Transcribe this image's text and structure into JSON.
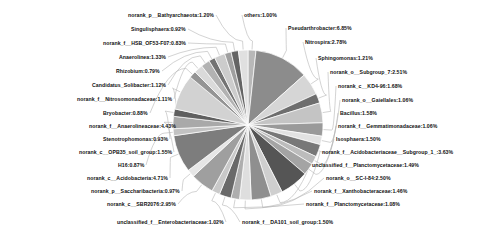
{
  "chart_data": {
    "type": "pie",
    "title": "",
    "xlabel": "",
    "ylabel": "",
    "legend_position": "none",
    "grid": false,
    "label_format": "name:percent",
    "center": [
      248,
      125
    ],
    "radius": 75,
    "categories": [
      "others",
      "Pseudarthrobacter",
      "Nitrospira",
      "Sphingomonas",
      "norank_o__Subgroup_7",
      "norank_c__KD4-96",
      "norank_o__Gaiellales",
      "Bacillus",
      "norank_f__Gemmatimonadaceae",
      "Isosphaera",
      "norank_f__Acidobacteriaceae__Subgroup_1_",
      "unclassified_f__Planctomycetaceae",
      "norank_o__SC-I-84",
      "norank_f__Xanthobacteraceae",
      "norank_f__Planctomycetaceae",
      "norank_f__DA101_soil_group",
      "unclassified_f__Enterobacteriaceae",
      "norank_c__SBR2076",
      "norank_p__Saccharibacteria",
      "norank_c__Acidobacteria",
      "H16",
      "norank_c__OPB35_soil_group",
      "Stenotrophomonas",
      "norank_f__Anaerolineaceae",
      "Bryobacter",
      "norank_f__Nitrosomonadaceae",
      "Candidatus_Solibacter",
      "Rhizobium",
      "Anaerolinea",
      "norank_f__HSB_OF53-F07",
      "Singulisphaera",
      "norank_p__Bathyarchaeota"
    ],
    "values": [
      1.0,
      6.85,
      2.78,
      1.21,
      2.51,
      1.68,
      1.06,
      1.58,
      1.06,
      1.5,
      3.63,
      1.49,
      2.5,
      1.46,
      1.08,
      1.5,
      1.02,
      2.95,
      0.97,
      4.71,
      0.87,
      1.55,
      0.93,
      4.43,
      0.88,
      1.11,
      1.12,
      0.79,
      1.33,
      0.83,
      0.92,
      1.2
    ],
    "labels": [
      "others:1.00%",
      "Pseudarthrobacter:6.85%",
      "Nitrospira:2.78%",
      "Sphingomonas:1.21%",
      "norank_o__Subgroup_7:2.51%",
      "norank_c__KD4-96:1.68%",
      "norank_o__Gaiellales:1.06%",
      "Bacillus:1.58%",
      "norank_f__Gemmatimonadaceae:1.06%",
      "Isosphaera:1.50%",
      "norank_f__Acidobacteriaceae__Subgroup_1_:3.63%",
      "unclassified_f__Planctomycetaceae:1.49%",
      "norank_o__SC-I-84:2.50%",
      "norank_f__Xanthobacteraceae:1.46%",
      "norank_f__Planctomycetaceae:1.08%",
      "norank_f__DA101_soil_group:1.50%",
      "unclassified_f__Enterobacteriaceae:1.02%",
      "norank_c__SBR2076:2.95%",
      "norank_p__Saccharibacteria:0.97%",
      "norank_c__Acidobacteria:4.71%",
      "H16:0.87%",
      "norank_c__OPB35_soil_group:1.55%",
      "Stenotrophomonas:0.93%",
      "norank_f__Anaerolineaceae:4.43%",
      "Bryobacter:0.88%",
      "norank_f__Nitrosomonadaceae:1.11%",
      "Candidatus_Solibacter:1.12%",
      "Rhizobium:0.79%",
      "Anaerolinea:1.33%",
      "norank_f__HSB_OF53-F07:0.83%",
      "Singulisphaera:0.92%",
      "norank_p__Bathyarchaeota:1.20%"
    ],
    "colors": [
      "#b8b8b8",
      "#8c8c8c",
      "#d6d6d6",
      "#6e6e6e",
      "#c4c4c4",
      "#9a9a9a",
      "#e2e2e2",
      "#787878",
      "#bcbcbc",
      "#a4a4a4",
      "#555555",
      "#cfcfcf",
      "#8f8f8f",
      "#dedede",
      "#aeaeae",
      "#696969",
      "#c9c9c9",
      "#9f9f9f",
      "#e6e6e6",
      "#7d7d7d",
      "#c2c2c2",
      "#a9a9a9",
      "#5f5f5f",
      "#d2d2d2",
      "#949494",
      "#dadada",
      "#b2b2b2",
      "#737373",
      "#cccccc",
      "#a0a0a0",
      "#646464",
      "#e0e0e0"
    ],
    "label_anchors": {
      "right": [
        {
          "text_key": 0,
          "x": 244,
          "y": 15,
          "side": "right"
        },
        {
          "text_key": 1,
          "x": 288,
          "y": 28,
          "side": "right"
        },
        {
          "text_key": 2,
          "x": 305,
          "y": 42,
          "side": "right"
        },
        {
          "text_key": 3,
          "x": 318,
          "y": 58,
          "side": "right"
        },
        {
          "text_key": 4,
          "x": 330,
          "y": 72,
          "side": "right"
        },
        {
          "text_key": 5,
          "x": 338,
          "y": 86,
          "side": "right"
        },
        {
          "text_key": 6,
          "x": 342,
          "y": 100,
          "side": "right"
        },
        {
          "text_key": 7,
          "x": 340,
          "y": 113,
          "side": "right"
        },
        {
          "text_key": 8,
          "x": 338,
          "y": 126,
          "side": "right"
        },
        {
          "text_key": 9,
          "x": 336,
          "y": 139,
          "side": "right"
        },
        {
          "text_key": 10,
          "x": 322,
          "y": 152,
          "side": "right"
        },
        {
          "text_key": 11,
          "x": 312,
          "y": 165,
          "side": "right"
        },
        {
          "text_key": 12,
          "x": 326,
          "y": 178,
          "side": "right"
        },
        {
          "text_key": 13,
          "x": 314,
          "y": 191,
          "side": "right"
        },
        {
          "text_key": 14,
          "x": 306,
          "y": 204,
          "side": "right"
        },
        {
          "text_key": 15,
          "x": 242,
          "y": 222,
          "side": "right"
        }
      ],
      "left": [
        {
          "text_key": 31,
          "x": 214,
          "y": 15,
          "side": "left"
        },
        {
          "text_key": 30,
          "x": 186,
          "y": 29,
          "side": "left"
        },
        {
          "text_key": 29,
          "x": 186,
          "y": 43,
          "side": "left"
        },
        {
          "text_key": 28,
          "x": 166,
          "y": 57,
          "side": "left"
        },
        {
          "text_key": 27,
          "x": 160,
          "y": 71,
          "side": "left"
        },
        {
          "text_key": 26,
          "x": 166,
          "y": 85,
          "side": "left"
        },
        {
          "text_key": 25,
          "x": 172,
          "y": 99,
          "side": "left"
        },
        {
          "text_key": 24,
          "x": 148,
          "y": 113,
          "side": "left"
        },
        {
          "text_key": 23,
          "x": 176,
          "y": 126,
          "side": "left"
        },
        {
          "text_key": 22,
          "x": 168,
          "y": 139,
          "side": "left"
        },
        {
          "text_key": 21,
          "x": 172,
          "y": 152,
          "side": "left"
        },
        {
          "text_key": 20,
          "x": 144,
          "y": 165,
          "side": "left"
        },
        {
          "text_key": 19,
          "x": 168,
          "y": 178,
          "side": "left"
        },
        {
          "text_key": 18,
          "x": 180,
          "y": 191,
          "side": "left"
        },
        {
          "text_key": 17,
          "x": 176,
          "y": 204,
          "side": "left"
        },
        {
          "text_key": 16,
          "x": 224,
          "y": 222,
          "side": "left"
        }
      ]
    }
  }
}
